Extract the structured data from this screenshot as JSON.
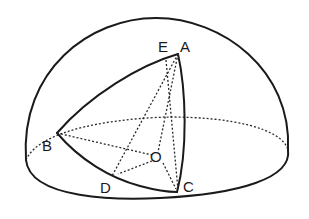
{
  "figure": {
    "labels": {
      "A": "A",
      "B": "B",
      "C": "C",
      "D": "D",
      "E": "E",
      "O": "O"
    },
    "colors": {
      "stroke": "#1a1a1a",
      "background": "#ffffff"
    }
  }
}
